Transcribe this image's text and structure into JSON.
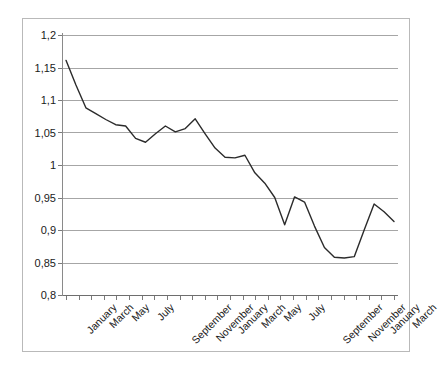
{
  "chart_data": {
    "type": "line",
    "title": "",
    "subtitle": "",
    "xlabel": "",
    "ylabel": "",
    "ylim": [
      0.8,
      1.2
    ],
    "ytick_step": 0.05,
    "ytick_labels": [
      "1,2",
      "1,15",
      "1,1",
      "1,05",
      "1",
      "0,95",
      "0,9",
      "0,85",
      "0,8"
    ],
    "ytick_values": [
      1.2,
      1.15,
      1.1,
      1.05,
      1.0,
      0.95,
      0.9,
      0.85,
      0.8
    ],
    "decimal_separator": ",",
    "grid": true,
    "grid_axis": "y",
    "legend": false,
    "legend_position": "none",
    "x_tick_count": 27,
    "xtick_labels": [
      "January",
      "",
      "March",
      "",
      "May",
      "",
      "July",
      "",
      "September",
      "",
      "November",
      "",
      "January",
      "",
      "March",
      "",
      "May",
      "",
      "July",
      "",
      "September",
      "",
      "November",
      "",
      "January",
      "",
      "March"
    ],
    "xtick_labels_visible": [
      "January",
      "March",
      "May",
      "July",
      "September",
      "November",
      "January",
      "March",
      "May",
      "July",
      "September",
      "November",
      "January",
      "March"
    ],
    "x_label_rotation_deg": -45,
    "categories": [
      "January",
      "February",
      "March",
      "April",
      "May",
      "June",
      "July",
      "August",
      "September",
      "October",
      "November",
      "December",
      "January",
      "February",
      "March",
      "April",
      "May",
      "June",
      "July",
      "August",
      "September",
      "October",
      "November",
      "December",
      "January",
      "February",
      "March"
    ],
    "series": [
      {
        "name": "Index",
        "color": "#2b2b2b",
        "values": [
          1.161,
          1.123,
          1.088,
          1.079,
          1.07,
          1.062,
          1.06,
          1.041,
          1.035,
          1.048,
          1.06,
          1.051,
          1.056,
          1.071,
          1.048,
          1.026,
          1.012,
          1.011,
          1.015,
          0.988,
          0.972,
          0.95,
          0.908,
          0.951,
          0.943,
          0.906,
          0.873
        ]
      }
    ],
    "extended_values_note": "",
    "values": [
      1.161,
      1.123,
      1.088,
      1.079,
      1.07,
      1.062,
      1.06,
      1.041,
      1.035,
      1.048,
      1.06,
      1.051,
      1.056,
      1.071,
      1.048,
      1.026,
      1.012,
      1.011,
      1.015,
      0.988,
      0.972,
      0.95,
      0.908,
      0.951,
      0.943,
      0.906,
      0.873
    ],
    "series_full": [
      1.161,
      1.123,
      1.088,
      1.079,
      1.07,
      1.062,
      1.06,
      1.041,
      1.035,
      1.048,
      1.06,
      1.051,
      1.056,
      1.071,
      1.048,
      1.026,
      1.012,
      1.011,
      1.015,
      0.988,
      0.972,
      0.95,
      0.908,
      0.951,
      0.943,
      0.906,
      0.873,
      0.858,
      0.857,
      0.859,
      0.9,
      0.94,
      0.928,
      0.913
    ],
    "min_value": 0.857,
    "max_value": 1.161,
    "line_color": "#2b2b2b",
    "grid_color": "#a6a6a6",
    "background_color": "#ffffff",
    "border_color": "#b9b9b9"
  }
}
